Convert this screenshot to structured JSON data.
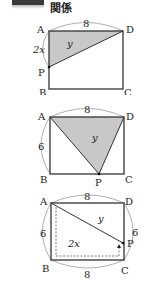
{
  "header": {
    "title": "関係"
  },
  "diagrams": [
    {
      "vertices": {
        "A": "A",
        "B": "B",
        "C": "C",
        "D": "D",
        "P": "P"
      },
      "side_top": "8",
      "side_left": "2x",
      "area_label": "y"
    },
    {
      "vertices": {
        "A": "A",
        "B": "B",
        "C": "C",
        "D": "D",
        "P": "P"
      },
      "side_top": "8",
      "side_left": "6",
      "area_label": "y"
    },
    {
      "vertices": {
        "A": "A",
        "B": "B",
        "C": "C",
        "D": "D",
        "P": "P"
      },
      "side_top": "8",
      "side_left": "6",
      "side_right": "6",
      "side_bottom": "8",
      "area_label": "y",
      "path_label": "2x"
    }
  ],
  "colors": {
    "shade": "#c8c8c8",
    "stroke": "#333333",
    "arc": "#999999"
  }
}
